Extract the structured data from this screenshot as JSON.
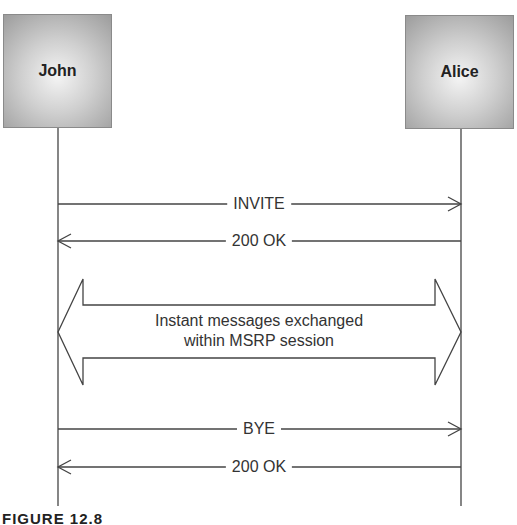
{
  "diagram": {
    "type": "sequence",
    "participants": [
      {
        "id": "john",
        "label": "John"
      },
      {
        "id": "alice",
        "label": "Alice"
      }
    ],
    "messages": [
      {
        "label": "INVITE",
        "from": "John",
        "to": "Alice"
      },
      {
        "label": "200 OK",
        "from": "Alice",
        "to": "John"
      },
      {
        "label": "Instant messages exchanged within MSRP session",
        "from": "John",
        "to": "Alice",
        "bidirectional": true
      },
      {
        "label": "BYE",
        "from": "John",
        "to": "Alice"
      },
      {
        "label": "200 OK",
        "from": "Alice",
        "to": "John"
      }
    ],
    "session": {
      "line1": "Instant messages exchanged",
      "line2": "within MSRP session"
    },
    "caption": "FIGURE 12.8"
  }
}
